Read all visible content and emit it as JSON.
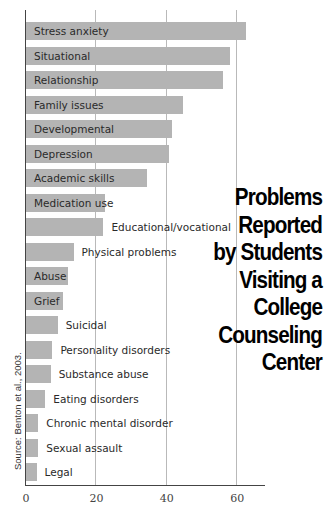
{
  "chart_data": {
    "type": "bar",
    "orientation": "horizontal",
    "title_lines": [
      "Problems",
      "Reported",
      "by Students",
      "Visiting a",
      "College",
      "Counseling",
      "Center"
    ],
    "source": "Source: Benton et al., 2003.",
    "xlabel": "",
    "ylabel": "",
    "xlim": [
      0,
      68
    ],
    "x_ticks": [
      0,
      20,
      40,
      60
    ],
    "x_tick_labels": [
      "0",
      "20",
      "40",
      "60"
    ],
    "grid": true,
    "categories": [
      "Stress anxiety",
      "Situational",
      "Relationship",
      "Family issues",
      "Developmental",
      "Depression",
      "Academic skills",
      "Medication use",
      "Educational/vocational",
      "Physical problems",
      "Abuse",
      "Grief",
      "Suicidal",
      "Personality disorders",
      "Substance abuse",
      "Eating disorders",
      "Chronic mental disorder",
      "Sexual assault",
      "Legal"
    ],
    "values": [
      62.5,
      58,
      56,
      44.5,
      41.5,
      40.5,
      34.5,
      22.5,
      22,
      13.5,
      12,
      10.5,
      9,
      7.5,
      7,
      5.5,
      3.5,
      3.5,
      3
    ],
    "colors": {
      "bar": "#b4b4b4",
      "text": "#2a2a2a",
      "grid": "#b9b9b9",
      "axis": "#444444"
    }
  }
}
